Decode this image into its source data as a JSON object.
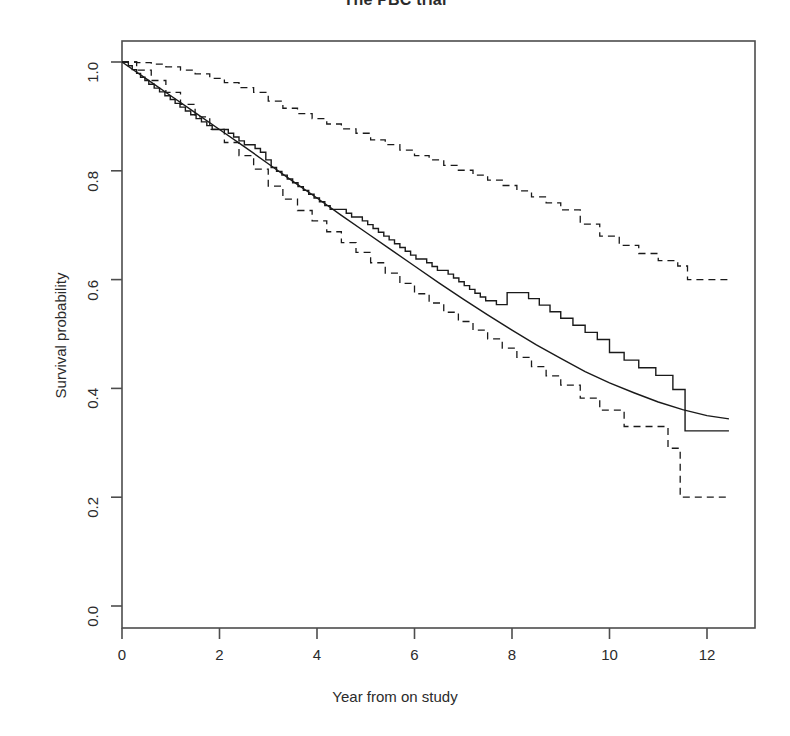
{
  "chart_data": {
    "type": "line",
    "title": "The PBC trial",
    "xlabel": "Year from on study",
    "ylabel": "Survival probability",
    "xlim": [
      -0.35,
      13.05
    ],
    "ylim": [
      -0.035,
      1.045
    ],
    "grid": false,
    "legend": "none",
    "xticks": [
      0,
      2,
      4,
      6,
      8,
      10,
      12
    ],
    "xticklabels": [
      "0",
      "2",
      "4",
      "6",
      "8",
      "10",
      "12"
    ],
    "yticks": [
      0.0,
      0.2,
      0.4,
      0.6,
      0.8,
      1.0
    ],
    "yticklabels": [
      "0.0",
      "0.2",
      "0.4",
      "0.6",
      "0.8",
      "1.0"
    ],
    "series": [
      {
        "name": "Kaplan-Meier estimate",
        "style": "step",
        "linestyle": "solid",
        "x": [
          0.0,
          0.13,
          0.21,
          0.3,
          0.38,
          0.47,
          0.55,
          0.66,
          0.77,
          0.88,
          0.99,
          1.09,
          1.19,
          1.3,
          1.41,
          1.52,
          1.63,
          1.74,
          1.85,
          1.96,
          2.07,
          2.18,
          2.29,
          2.4,
          2.51,
          2.62,
          2.73,
          2.84,
          2.95,
          3.06,
          3.17,
          3.28,
          3.39,
          3.5,
          3.61,
          3.72,
          3.83,
          3.94,
          4.05,
          4.16,
          4.27,
          4.38,
          4.49,
          4.6,
          4.71,
          4.82,
          4.93,
          5.04,
          5.15,
          5.26,
          5.37,
          5.48,
          5.59,
          5.7,
          5.81,
          5.92,
          6.03,
          6.14,
          6.25,
          6.36,
          6.47,
          6.58,
          6.69,
          6.8,
          6.91,
          7.02,
          7.13,
          7.24,
          7.35,
          7.46,
          7.57,
          7.68,
          7.9,
          8.12,
          8.34,
          8.56,
          8.78,
          9.0,
          9.25,
          9.5,
          9.75,
          10.0,
          10.3,
          10.6,
          10.95,
          11.3,
          11.55,
          12.45
        ],
        "y": [
          1.0,
          0.993,
          0.986,
          0.979,
          0.972,
          0.966,
          0.959,
          0.952,
          0.945,
          0.938,
          0.931,
          0.924,
          0.917,
          0.91,
          0.903,
          0.896,
          0.89,
          0.883,
          0.876,
          0.876,
          0.876,
          0.869,
          0.862,
          0.855,
          0.848,
          0.848,
          0.841,
          0.834,
          0.82,
          0.806,
          0.799,
          0.792,
          0.785,
          0.778,
          0.771,
          0.764,
          0.757,
          0.75,
          0.743,
          0.736,
          0.729,
          0.729,
          0.729,
          0.722,
          0.715,
          0.715,
          0.708,
          0.701,
          0.694,
          0.687,
          0.68,
          0.673,
          0.666,
          0.659,
          0.652,
          0.645,
          0.638,
          0.638,
          0.631,
          0.624,
          0.617,
          0.617,
          0.61,
          0.603,
          0.596,
          0.589,
          0.582,
          0.575,
          0.568,
          0.561,
          0.561,
          0.554,
          0.576,
          0.576,
          0.565,
          0.553,
          0.541,
          0.529,
          0.516,
          0.503,
          0.49,
          0.466,
          0.452,
          0.438,
          0.424,
          0.398,
          0.322,
          0.322
        ],
        "note": "Step function descending from 1.00 at year 0 to a flat 0.32 tail from about year 11.6 to 12.45"
      },
      {
        "name": "Fitted parametric survival curve",
        "style": "smooth",
        "linestyle": "solid",
        "x": [
          0.0,
          0.5,
          1.0,
          1.5,
          2.0,
          2.5,
          3.0,
          3.5,
          4.0,
          4.5,
          5.0,
          5.5,
          6.0,
          6.5,
          7.0,
          7.5,
          8.0,
          8.5,
          9.0,
          9.5,
          10.0,
          10.5,
          11.0,
          11.5,
          12.0,
          12.45
        ],
        "y": [
          1.0,
          0.969,
          0.938,
          0.907,
          0.876,
          0.845,
          0.813,
          0.781,
          0.75,
          0.718,
          0.687,
          0.656,
          0.625,
          0.594,
          0.564,
          0.535,
          0.507,
          0.48,
          0.455,
          0.431,
          0.41,
          0.392,
          0.375,
          0.361,
          0.35,
          0.344
        ],
        "note": "Slightly convex smooth fit running through the middle of the step curve"
      },
      {
        "name": "Upper 95% confidence limit",
        "style": "step",
        "linestyle": "dashed",
        "x": [
          0.0,
          0.3,
          0.6,
          0.9,
          1.2,
          1.5,
          1.8,
          2.1,
          2.4,
          2.7,
          3.0,
          3.3,
          3.6,
          3.9,
          4.2,
          4.5,
          4.8,
          5.1,
          5.4,
          5.7,
          6.0,
          6.3,
          6.6,
          6.9,
          7.2,
          7.5,
          7.8,
          8.1,
          8.4,
          8.7,
          9.0,
          9.4,
          9.8,
          10.2,
          10.6,
          11.0,
          11.4,
          11.6,
          12.45
        ],
        "y": [
          1.0,
          0.999,
          0.996,
          0.991,
          0.985,
          0.978,
          0.97,
          0.962,
          0.953,
          0.944,
          0.928,
          0.915,
          0.905,
          0.896,
          0.886,
          0.877,
          0.869,
          0.857,
          0.848,
          0.838,
          0.828,
          0.82,
          0.81,
          0.801,
          0.792,
          0.783,
          0.773,
          0.763,
          0.752,
          0.741,
          0.728,
          0.702,
          0.68,
          0.663,
          0.648,
          0.635,
          0.625,
          0.6,
          0.6
        ],
        "note": "Dashed upper band, ends flat near 0.52 after a drop around year 11.3"
      },
      {
        "name": "Lower 95% confidence limit",
        "style": "step",
        "linestyle": "dashed",
        "x": [
          0.0,
          0.3,
          0.6,
          0.9,
          1.2,
          1.5,
          1.8,
          2.1,
          2.4,
          2.7,
          3.0,
          3.3,
          3.6,
          3.9,
          4.2,
          4.5,
          4.8,
          5.1,
          5.4,
          5.7,
          6.0,
          6.3,
          6.6,
          6.9,
          7.2,
          7.5,
          7.8,
          8.1,
          8.4,
          8.7,
          9.0,
          9.4,
          9.8,
          10.3,
          10.8,
          11.2,
          11.45,
          12.45
        ],
        "y": [
          1.0,
          0.985,
          0.966,
          0.944,
          0.922,
          0.899,
          0.876,
          0.852,
          0.828,
          0.803,
          0.772,
          0.748,
          0.727,
          0.708,
          0.688,
          0.668,
          0.65,
          0.631,
          0.612,
          0.593,
          0.574,
          0.557,
          0.54,
          0.523,
          0.507,
          0.491,
          0.474,
          0.457,
          0.44,
          0.423,
          0.406,
          0.382,
          0.36,
          0.33,
          0.33,
          0.29,
          0.2,
          0.2
        ],
        "note": "Dashed lower band, descends to a flat 0.20 tail after a sharp drop near year 11.4"
      }
    ]
  },
  "axes": {
    "x_tick_labels": [
      "0",
      "2",
      "4",
      "6",
      "8",
      "10",
      "12"
    ],
    "y_tick_labels": [
      "0.0",
      "0.2",
      "0.4",
      "0.6",
      "0.8",
      "1.0"
    ]
  },
  "colors": {
    "line": "#1a1a1a",
    "axis": "#4d4d4d",
    "text": "#2b2b2b",
    "background": "#ffffff"
  }
}
